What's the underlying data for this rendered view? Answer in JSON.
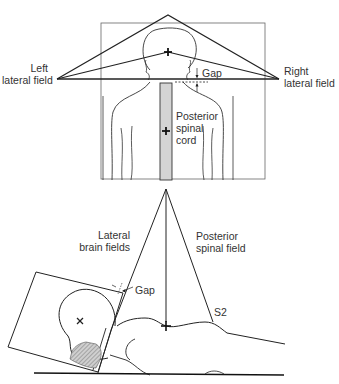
{
  "figure": {
    "top_view": {
      "left_field_label_line1": "Left",
      "left_field_label_line2": "lateral field",
      "right_field_label_line1": "Right",
      "right_field_label_line2": "lateral field",
      "gap_label": "Gap",
      "spinal_label_line1": "Posterior",
      "spinal_label_line2": "spinal",
      "spinal_label_line3": "cord"
    },
    "side_view": {
      "brain_label_line1": "Lateral",
      "brain_label_line2": "brain fields",
      "spinal_label_line1": "Posterior",
      "spinal_label_line2": "spinal field",
      "gap_label": "Gap",
      "s2_label": "S2"
    },
    "colors": {
      "line": "#222222",
      "spinal_field_fill": "#d4d4d4",
      "hatch": "#888888"
    }
  }
}
